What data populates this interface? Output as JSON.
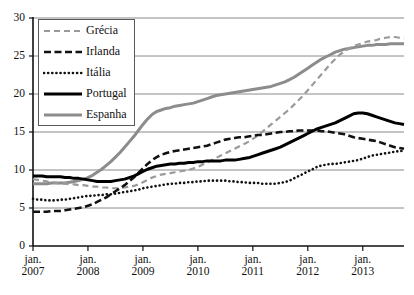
{
  "chart_data": {
    "type": "line",
    "title": "",
    "subtitle": "",
    "xlabel": "",
    "ylabel": "",
    "xlim": [
      2007.0,
      2013.75
    ],
    "ylim": [
      0,
      30
    ],
    "grid": true,
    "grid_axis": "y",
    "legend_position": "top-left",
    "y_ticks": [
      0,
      5,
      10,
      15,
      20,
      25,
      30
    ],
    "y_tick_labels": [
      "0",
      "5",
      "10",
      "15",
      "20",
      "25",
      "30"
    ],
    "x_ticks": [
      2007,
      2008,
      2009,
      2010,
      2011,
      2012,
      2013
    ],
    "x_tick_labels": [
      {
        "line1": "jan.",
        "line2": "2007"
      },
      {
        "line1": "jan.",
        "line2": "2008"
      },
      {
        "line1": "jan.",
        "line2": "2009"
      },
      {
        "line1": "jan.",
        "line2": "2010"
      },
      {
        "line1": "jan.",
        "line2": "2011"
      },
      {
        "line1": "jan.",
        "line2": "2012"
      },
      {
        "line1": "jan.",
        "line2": "2013"
      }
    ],
    "x": [
      2007.0,
      2007.0833,
      2007.1667,
      2007.25,
      2007.3333,
      2007.4167,
      2007.5,
      2007.5833,
      2007.6667,
      2007.75,
      2007.8333,
      2007.9167,
      2008.0,
      2008.0833,
      2008.1667,
      2008.25,
      2008.3333,
      2008.4167,
      2008.5,
      2008.5833,
      2008.6667,
      2008.75,
      2008.8333,
      2008.9167,
      2009.0,
      2009.0833,
      2009.1667,
      2009.25,
      2009.3333,
      2009.4167,
      2009.5,
      2009.5833,
      2009.6667,
      2009.75,
      2009.8333,
      2009.9167,
      2010.0,
      2010.0833,
      2010.1667,
      2010.25,
      2010.3333,
      2010.4167,
      2010.5,
      2010.5833,
      2010.6667,
      2010.75,
      2010.8333,
      2010.9167,
      2011.0,
      2011.0833,
      2011.1667,
      2011.25,
      2011.3333,
      2011.4167,
      2011.5,
      2011.5833,
      2011.6667,
      2011.75,
      2011.8333,
      2011.9167,
      2012.0,
      2012.0833,
      2012.1667,
      2012.25,
      2012.3333,
      2012.4167,
      2012.5,
      2012.5833,
      2012.6667,
      2012.75,
      2012.8333,
      2012.9167,
      2013.0,
      2013.0833,
      2013.1667,
      2013.25,
      2013.3333,
      2013.4167,
      2013.5,
      2013.5833,
      2013.6667,
      2013.75
    ],
    "series": [
      {
        "name": "Grécia",
        "color": "#9a9a9a",
        "style": "dashed",
        "width": 2.2,
        "values": [
          8.8,
          8.7,
          8.6,
          8.5,
          8.4,
          8.3,
          8.2,
          8.2,
          8.1,
          8.1,
          8.0,
          8.0,
          7.9,
          7.8,
          7.8,
          7.7,
          7.7,
          7.6,
          7.6,
          7.6,
          7.7,
          7.8,
          7.9,
          8.1,
          8.4,
          8.7,
          9.0,
          9.2,
          9.4,
          9.5,
          9.6,
          9.7,
          9.8,
          9.9,
          10.0,
          10.2,
          10.4,
          10.7,
          11.0,
          11.3,
          11.6,
          11.9,
          12.2,
          12.5,
          12.8,
          13.1,
          13.4,
          13.7,
          14.1,
          14.5,
          15.0,
          15.5,
          16.0,
          16.5,
          17.0,
          17.5,
          18.0,
          18.6,
          19.2,
          19.8,
          20.5,
          21.2,
          21.9,
          22.6,
          23.3,
          24.0,
          24.6,
          25.2,
          25.6,
          26.0,
          26.3,
          26.5,
          26.7,
          26.9,
          27.0,
          27.1,
          27.3,
          27.4,
          27.5,
          27.5,
          27.4,
          27.3
        ]
      },
      {
        "name": "Irlanda",
        "color": "#111111",
        "style": "dashed",
        "width": 2.6,
        "values": [
          4.5,
          4.5,
          4.5,
          4.5,
          4.6,
          4.6,
          4.6,
          4.7,
          4.8,
          4.9,
          5.0,
          5.1,
          5.3,
          5.5,
          5.8,
          6.1,
          6.4,
          6.8,
          7.2,
          7.6,
          8.0,
          8.5,
          9.0,
          9.6,
          10.2,
          10.8,
          11.3,
          11.7,
          12.0,
          12.2,
          12.4,
          12.5,
          12.6,
          12.7,
          12.8,
          12.9,
          13.0,
          13.1,
          13.2,
          13.4,
          13.6,
          13.8,
          14.0,
          14.1,
          14.2,
          14.3,
          14.3,
          14.4,
          14.5,
          14.6,
          14.6,
          14.7,
          14.8,
          14.9,
          15.0,
          15.0,
          15.1,
          15.1,
          15.2,
          15.2,
          15.2,
          15.2,
          15.2,
          15.1,
          15.1,
          15.0,
          14.9,
          14.8,
          14.7,
          14.5,
          14.3,
          14.2,
          14.1,
          14.0,
          13.9,
          13.8,
          13.6,
          13.4,
          13.2,
          13.0,
          12.9,
          12.8
        ]
      },
      {
        "name": "Itália",
        "color": "#111111",
        "style": "dotted",
        "width": 2.6,
        "values": [
          6.2,
          6.1,
          6.1,
          6.0,
          6.0,
          6.0,
          6.1,
          6.1,
          6.2,
          6.3,
          6.4,
          6.5,
          6.6,
          6.6,
          6.7,
          6.7,
          6.8,
          6.8,
          6.9,
          7.0,
          7.1,
          7.2,
          7.3,
          7.4,
          7.6,
          7.7,
          7.8,
          7.9,
          8.0,
          8.1,
          8.2,
          8.2,
          8.3,
          8.3,
          8.4,
          8.4,
          8.5,
          8.5,
          8.6,
          8.6,
          8.6,
          8.6,
          8.6,
          8.5,
          8.5,
          8.4,
          8.4,
          8.3,
          8.3,
          8.3,
          8.2,
          8.2,
          8.2,
          8.2,
          8.3,
          8.4,
          8.6,
          8.9,
          9.2,
          9.5,
          9.8,
          10.1,
          10.4,
          10.6,
          10.7,
          10.8,
          10.8,
          10.9,
          11.0,
          11.1,
          11.2,
          11.3,
          11.5,
          11.7,
          11.9,
          12.0,
          12.1,
          12.2,
          12.3,
          12.4,
          12.5,
          12.5
        ]
      },
      {
        "name": "Portugal",
        "color": "#000000",
        "style": "solid",
        "width": 3.0,
        "values": [
          9.2,
          9.2,
          9.2,
          9.1,
          9.1,
          9.1,
          9.1,
          9.0,
          9.0,
          8.9,
          8.9,
          8.8,
          8.7,
          8.6,
          8.5,
          8.5,
          8.5,
          8.5,
          8.6,
          8.7,
          8.8,
          9.0,
          9.2,
          9.5,
          9.8,
          10.1,
          10.3,
          10.5,
          10.6,
          10.7,
          10.8,
          10.8,
          10.9,
          10.9,
          11.0,
          11.0,
          11.1,
          11.1,
          11.2,
          11.2,
          11.2,
          11.2,
          11.3,
          11.3,
          11.3,
          11.4,
          11.5,
          11.6,
          11.8,
          12.0,
          12.2,
          12.4,
          12.6,
          12.8,
          13.0,
          13.3,
          13.6,
          13.9,
          14.2,
          14.5,
          14.8,
          15.1,
          15.4,
          15.6,
          15.8,
          16.0,
          16.2,
          16.5,
          16.8,
          17.1,
          17.4,
          17.5,
          17.5,
          17.4,
          17.2,
          17.0,
          16.8,
          16.6,
          16.4,
          16.2,
          16.1,
          16.0
        ]
      },
      {
        "name": "Espanha",
        "color": "#8c8c8c",
        "style": "solid",
        "width": 3.0,
        "values": [
          8.2,
          8.2,
          8.2,
          8.2,
          8.3,
          8.3,
          8.3,
          8.3,
          8.4,
          8.5,
          8.6,
          8.8,
          9.0,
          9.3,
          9.7,
          10.1,
          10.6,
          11.1,
          11.7,
          12.3,
          13.0,
          13.7,
          14.4,
          15.2,
          16.0,
          16.7,
          17.3,
          17.7,
          17.9,
          18.1,
          18.2,
          18.4,
          18.5,
          18.6,
          18.7,
          18.8,
          19.0,
          19.2,
          19.4,
          19.6,
          19.8,
          19.9,
          20.0,
          20.1,
          20.2,
          20.3,
          20.4,
          20.5,
          20.6,
          20.7,
          20.8,
          20.9,
          21.0,
          21.2,
          21.4,
          21.6,
          21.9,
          22.2,
          22.6,
          23.0,
          23.4,
          23.8,
          24.2,
          24.6,
          24.9,
          25.2,
          25.5,
          25.7,
          25.9,
          26.0,
          26.1,
          26.2,
          26.3,
          26.4,
          26.4,
          26.5,
          26.5,
          26.5,
          26.6,
          26.6,
          26.6,
          26.6
        ]
      }
    ]
  },
  "legend": {
    "items": [
      {
        "label": "Grécia"
      },
      {
        "label": "Irlanda"
      },
      {
        "label": "Itália"
      },
      {
        "label": "Portugal"
      },
      {
        "label": "Espanha"
      }
    ]
  }
}
